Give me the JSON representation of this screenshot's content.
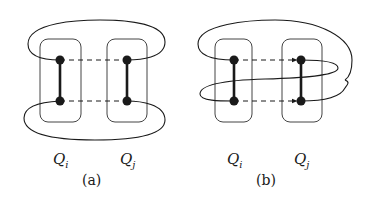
{
  "figure": {
    "panels": [
      {
        "id": "a",
        "caption": "(a)",
        "clusters": [
          {
            "label": "Q",
            "sub": "i"
          },
          {
            "label": "Q",
            "sub": "j"
          }
        ],
        "edges": "dashed undirected between clusters",
        "loop": "two separate loops around top and bottom"
      },
      {
        "id": "b",
        "caption": "(b)",
        "clusters": [
          {
            "label": "Q",
            "sub": "i"
          },
          {
            "label": "Q",
            "sub": "j"
          }
        ],
        "edges": "dashed directed arrows from Qi to Qj",
        "loop": "single figure-eight loop crossing through both clusters"
      }
    ]
  },
  "colors": {
    "stroke": "#1a1a1a",
    "box": "#444444",
    "background": "#ffffff"
  }
}
